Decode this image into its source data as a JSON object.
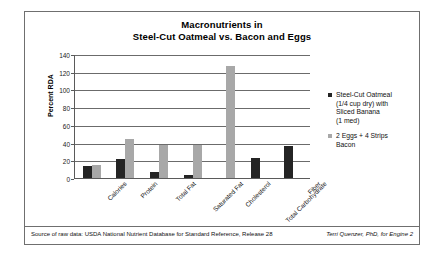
{
  "chart_data": {
    "type": "bar",
    "title": "Macronutrients in Steel-Cut Oatmeal vs. Bacon and Eggs",
    "title_line1": "Macronutrients in",
    "title_line2": "Steel-Cut Oatmeal vs. Bacon and Eggs",
    "xlabel": "",
    "ylabel": "Percent RDA",
    "ylim": [
      0,
      140
    ],
    "ytick_step": 20,
    "yticks": [
      0,
      20,
      40,
      60,
      80,
      100,
      120,
      140
    ],
    "grid": true,
    "legend_position": "right",
    "categories": [
      "Calories",
      "Protein",
      "Total Fat",
      "Saturated Fat",
      "Cholesterol",
      "Total Carbohydrate",
      "Fiber"
    ],
    "series": [
      {
        "name": "Steel-Cut Oatmeal (1/4 cup dry) with Sliced Banana (1 med)",
        "color": "#242424",
        "values": [
          14,
          21,
          7,
          3,
          0,
          23,
          36
        ]
      },
      {
        "name": "2 Eggs + 4 Strips Bacon",
        "color": "#a8a8a8",
        "values": [
          15,
          44,
          37,
          37,
          126,
          0,
          0
        ]
      }
    ]
  },
  "legend": {
    "items": [
      {
        "swatch_color": "#242424",
        "lines": [
          "Steel-Cut Oatmeal",
          "(1/4 cup dry) with",
          "Sliced Banana",
          "(1 med)"
        ]
      },
      {
        "swatch_color": "#a8a8a8",
        "lines": [
          "2 Eggs + 4 Strips",
          "Bacon"
        ]
      }
    ]
  },
  "footer": {
    "source": "Source of raw data: USDA National Nutrient Database for Standard Reference, Release 28",
    "credit": "Terri Quenzer, PhD, for Engine 2"
  }
}
